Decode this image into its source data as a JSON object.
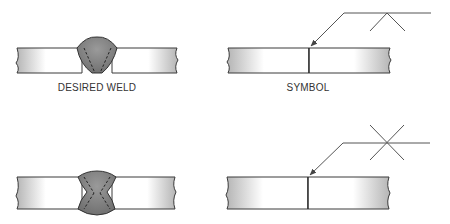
{
  "figure": {
    "panels": [
      {
        "id": "desired-weld-single-v",
        "label": "DESIRED WELD",
        "type": "weld-cross-section",
        "weld": "single-V groove"
      },
      {
        "id": "symbol-single-v",
        "label": "SYMBOL",
        "type": "weld-symbol",
        "symbol": "V-groove (arrow side)"
      },
      {
        "id": "desired-weld-double-v",
        "label": "",
        "type": "weld-cross-section",
        "weld": "double-V groove"
      },
      {
        "id": "symbol-double-v",
        "label": "",
        "type": "weld-symbol",
        "symbol": "double-V groove (both sides)"
      }
    ],
    "colors": {
      "outline": "#3a3a3a",
      "weld_fill": "#7a7a7a",
      "plate_dark": "#b8b8b8",
      "plate_light": "#ffffff",
      "line": "#555555"
    }
  }
}
